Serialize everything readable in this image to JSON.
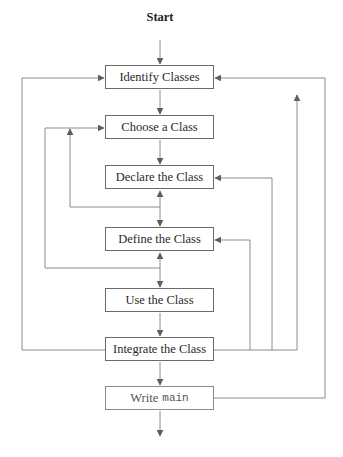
{
  "diagram": {
    "start_label": "Start",
    "steps": [
      {
        "id": "identify",
        "label": "Identify Classes"
      },
      {
        "id": "choose",
        "label": "Choose a Class"
      },
      {
        "id": "declare",
        "label": "Declare the Class"
      },
      {
        "id": "define",
        "label": "Define the Class"
      },
      {
        "id": "use",
        "label": "Use the Class"
      },
      {
        "id": "integrate",
        "label": "Integrate the Class"
      },
      {
        "id": "write_main",
        "label_text": "Write",
        "label_code": "main"
      }
    ],
    "edges": [
      {
        "from": "start",
        "to": "identify"
      },
      {
        "from": "identify",
        "to": "choose"
      },
      {
        "from": "choose",
        "to": "declare"
      },
      {
        "from": "declare",
        "to": "define",
        "bidirectional": true
      },
      {
        "from": "define",
        "to": "use",
        "bidirectional": true
      },
      {
        "from": "use",
        "to": "integrate"
      },
      {
        "from": "integrate",
        "to": "write_main"
      },
      {
        "from": "write_main",
        "to": "end"
      },
      {
        "from": "integrate",
        "to": "identify",
        "side": "left"
      },
      {
        "from": "define_use_junction",
        "to": "choose",
        "side": "left"
      },
      {
        "from": "declare_define_junction",
        "to": "choose",
        "side": "left"
      },
      {
        "from": "integrate",
        "to": "define",
        "side": "right"
      },
      {
        "from": "integrate",
        "to": "declare",
        "side": "right"
      },
      {
        "from": "integrate",
        "to": "identify",
        "side": "right"
      },
      {
        "from": "write_main",
        "to": "identify",
        "side": "right"
      }
    ],
    "colors": {
      "line": "#8c8c8c",
      "arrow": "#5f5f5f",
      "box_border": "#6a6a6a",
      "text": "#2a2a2a"
    }
  }
}
